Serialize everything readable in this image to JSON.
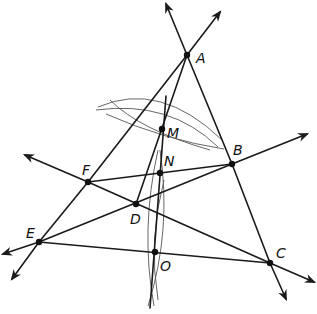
{
  "diagram": {
    "type": "geometric-construction",
    "colors": {
      "line": "#1a1a1a",
      "arc": "#555555",
      "point": "#111111",
      "background": "#ffffff"
    },
    "points": [
      {
        "id": "A",
        "label": "A",
        "x": 187,
        "y": 55,
        "lx": 196,
        "ly": 63
      },
      {
        "id": "B",
        "label": "B",
        "x": 232,
        "y": 164,
        "lx": 233,
        "ly": 155
      },
      {
        "id": "C",
        "label": "C",
        "x": 270,
        "y": 263,
        "lx": 276,
        "ly": 258
      },
      {
        "id": "D",
        "label": "D",
        "x": 136,
        "y": 204,
        "lx": 130,
        "ly": 224
      },
      {
        "id": "E",
        "label": "E",
        "x": 39,
        "y": 242,
        "lx": 26,
        "ly": 238
      },
      {
        "id": "F",
        "label": "F",
        "x": 88,
        "y": 182,
        "lx": 82,
        "ly": 175
      },
      {
        "id": "M",
        "label": "M",
        "x": 162,
        "y": 129,
        "lx": 167,
        "ly": 138
      },
      {
        "id": "N",
        "label": "N",
        "x": 160,
        "y": 173,
        "lx": 164,
        "ly": 166
      },
      {
        "id": "O",
        "label": "O",
        "x": 155,
        "y": 252,
        "lx": 160,
        "ly": 271
      }
    ],
    "rays": [
      {
        "name": "ray-A-up-left",
        "x1": 187,
        "y1": 55,
        "x2": 166,
        "y2": 4
      },
      {
        "name": "ray-A-up-right",
        "x1": 187,
        "y1": 55,
        "x2": 220,
        "y2": 12
      },
      {
        "name": "ray-B-right",
        "x1": 232,
        "y1": 164,
        "x2": 307,
        "y2": 134
      },
      {
        "name": "ray-F-left",
        "x1": 88,
        "y1": 182,
        "x2": 25,
        "y2": 155
      },
      {
        "name": "ray-E-left",
        "x1": 39,
        "y1": 242,
        "x2": 3,
        "y2": 254
      },
      {
        "name": "ray-E-down",
        "x1": 39,
        "y1": 242,
        "x2": 12,
        "y2": 279
      },
      {
        "name": "ray-C-right",
        "x1": 270,
        "y1": 263,
        "x2": 314,
        "y2": 282
      },
      {
        "name": "ray-C-down",
        "x1": 270,
        "y1": 263,
        "x2": 286,
        "y2": 299
      }
    ],
    "segments": [
      {
        "name": "segment-A-B",
        "x1": 187,
        "y1": 55,
        "x2": 232,
        "y2": 164
      },
      {
        "name": "segment-B-C",
        "x1": 232,
        "y1": 164,
        "x2": 270,
        "y2": 263
      },
      {
        "name": "segment-A-F",
        "x1": 187,
        "y1": 55,
        "x2": 88,
        "y2": 182
      },
      {
        "name": "segment-F-E",
        "x1": 88,
        "y1": 182,
        "x2": 39,
        "y2": 242
      },
      {
        "name": "segment-A-D",
        "x1": 187,
        "y1": 55,
        "x2": 136,
        "y2": 204
      },
      {
        "name": "segment-F-B",
        "x1": 88,
        "y1": 182,
        "x2": 232,
        "y2": 164
      },
      {
        "name": "segment-E-B",
        "x1": 39,
        "y1": 242,
        "x2": 232,
        "y2": 164
      },
      {
        "name": "segment-F-C",
        "x1": 88,
        "y1": 182,
        "x2": 270,
        "y2": 263
      },
      {
        "name": "segment-E-C",
        "x1": 39,
        "y1": 242,
        "x2": 270,
        "y2": 263
      },
      {
        "name": "segment-perp-bisector",
        "x1": 166,
        "y1": 96,
        "x2": 150,
        "y2": 308
      }
    ],
    "arcs": [
      {
        "name": "arc-upper-1",
        "d": "M 98 107 Q 160 80 222 140"
      },
      {
        "name": "arc-upper-2",
        "d": "M 106 114 Q 165 140 224 149"
      },
      {
        "name": "arc-upper-3",
        "d": "M 110 100 Q 140 130 210 150"
      },
      {
        "name": "arc-upper-4",
        "d": "M 96 110 Q 170 100 218 147"
      },
      {
        "name": "arc-lower-1",
        "d": "M 158 150 Q 140 230 154 306"
      },
      {
        "name": "arc-lower-2",
        "d": "M 160 150 Q 172 230 148 306"
      },
      {
        "name": "arc-lower-3",
        "d": "M 164 180 Q 148 240 158 300"
      }
    ]
  }
}
